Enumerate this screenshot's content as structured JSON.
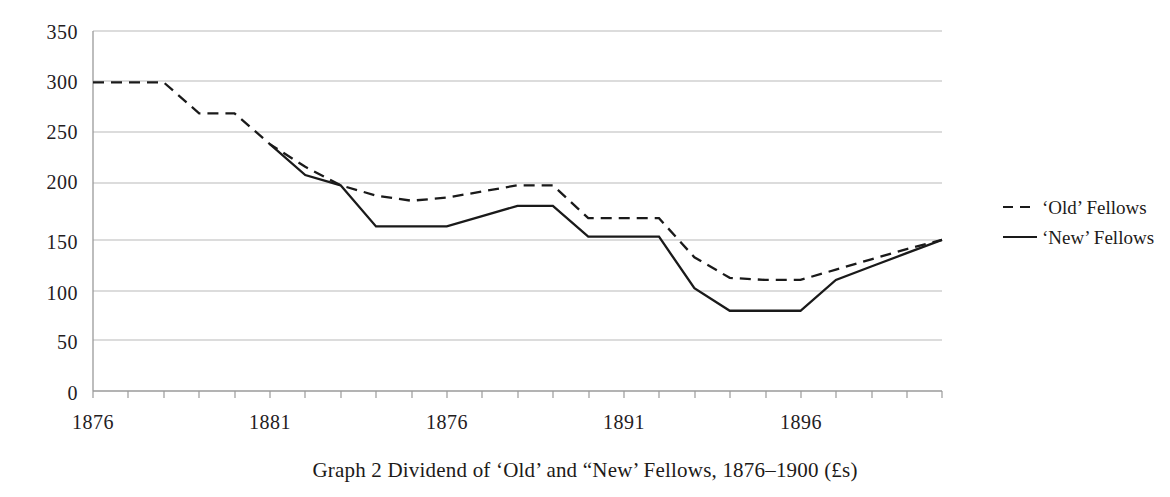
{
  "caption": "Graph 2  Dividend of ‘Old’ and “New’ Fellows, 1876–1900 (£s)",
  "legend": {
    "position": "right",
    "items": [
      {
        "label": "‘Old’ Fellows",
        "style": "dashed",
        "color": "#1a1a1a"
      },
      {
        "label": "‘New’ Fellows",
        "style": "solid",
        "color": "#1a1a1a"
      }
    ]
  },
  "axes": {
    "y_ticks": [
      "350",
      "300",
      "250",
      "200",
      "150",
      "100",
      "50",
      "0"
    ],
    "x_ticks": [
      "1876",
      "1881",
      "1876",
      "1891",
      "1896"
    ]
  },
  "chart_data": {
    "type": "line",
    "title": "Graph 2  Dividend of ‘Old’ and “New’ Fellows, 1876–1900 (£s)",
    "xlabel": "",
    "ylabel": "",
    "ylim": [
      0,
      350
    ],
    "ytick_values": [
      0,
      50,
      100,
      150,
      200,
      250,
      300,
      350
    ],
    "xtick_labels": [
      "1876",
      "1881",
      "1876",
      "1891",
      "1896"
    ],
    "xtick_years": [
      1876,
      1881,
      1886,
      1891,
      1896
    ],
    "grid": "horizontal",
    "x": [
      1876,
      1877,
      1878,
      1879,
      1880,
      1881,
      1882,
      1883,
      1884,
      1885,
      1886,
      1887,
      1888,
      1889,
      1890,
      1891,
      1892,
      1893,
      1894,
      1895,
      1896,
      1897,
      1898,
      1899,
      1900
    ],
    "series": [
      {
        "name": "‘Old’ Fellows",
        "style": "dashed",
        "values": [
          300,
          300,
          300,
          270,
          270,
          240,
          218,
          200,
          190,
          185,
          188,
          194,
          200,
          200,
          168,
          168,
          168,
          130,
          110,
          108,
          108,
          118,
          128,
          138,
          147
        ]
      },
      {
        "name": "‘New’ Fellows",
        "style": "solid",
        "values": [
          null,
          null,
          null,
          null,
          null,
          240,
          210,
          200,
          160,
          160,
          160,
          170,
          180,
          180,
          150,
          150,
          150,
          100,
          78,
          78,
          78,
          108,
          121,
          134,
          147
        ]
      }
    ]
  }
}
